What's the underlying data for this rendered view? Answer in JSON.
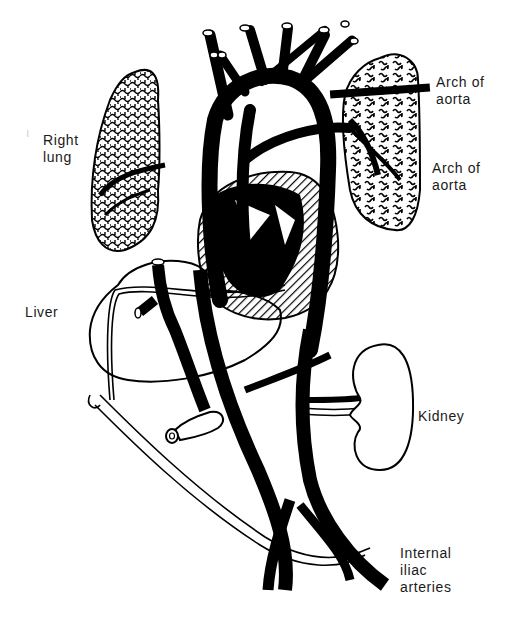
{
  "figure": {
    "stroke_color": "#000000",
    "background_color": "#ffffff"
  },
  "labels": {
    "arch_of_aorta_top": "Arch of\naorta",
    "right_lung": "Right\nlung",
    "arch_of_aorta_right": "Arch of\naorta",
    "liver": "Liver",
    "kidney": "Kidney",
    "internal_iliac_arteries": "Internal\niliac\narteries"
  },
  "marks": {
    "stray_mark": "ı"
  }
}
